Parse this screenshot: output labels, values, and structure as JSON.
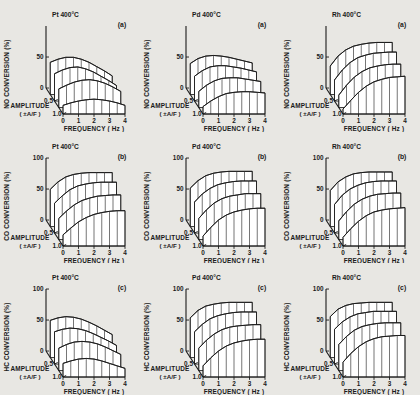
{
  "figure": {
    "background": "#e8e7e3",
    "ink": "#1a1a1a",
    "columns": [
      "Pt 400°C",
      "Pd 400°C",
      "Rh 400°C"
    ],
    "row_labels": [
      "NO CONVERSION (%)",
      "CO CONVERSION (%)",
      "HC CONVERSION (%)"
    ],
    "panel_labels": [
      "(a)",
      "(b)",
      "(c)"
    ],
    "x_axis": {
      "label": "FREQUENCY ( Hz )",
      "ticks": [
        "0",
        "1",
        "2",
        "3",
        "4"
      ],
      "range": [
        0,
        4
      ]
    },
    "y_axis": {
      "ticks_full": [
        "0",
        "50",
        "100"
      ],
      "ticks_row1": [
        "0",
        "50"
      ],
      "range": [
        0,
        100
      ]
    },
    "z_axis": {
      "label": "AMPLITUDE",
      "unit": "( ±A/F )",
      "ticks": [
        "0.5",
        "1.0"
      ],
      "range": [
        0,
        1.0
      ]
    }
  },
  "chart_data": {
    "type": "area",
    "xlabel": "FREQUENCY ( Hz )",
    "ylabel": "CONVERSION (%)",
    "zlabel": "AMPLITUDE ( ±A/F )",
    "xlim": [
      0,
      4
    ],
    "ylim": [
      0,
      100
    ],
    "zlim": [
      0,
      1.0
    ],
    "grid": false,
    "legend": "none",
    "x": [
      0,
      0.5,
      1,
      1.5,
      2,
      2.5,
      3,
      3.5,
      4
    ],
    "amplitudes": [
      0.25,
      0.5,
      0.75,
      1.0
    ],
    "panels": [
      {
        "id": "a1",
        "row": 0,
        "col": 0,
        "panel_label": "(a)",
        "catalyst": "Pt 400°C",
        "species": "NO CONVERSION (%)",
        "series": [
          {
            "name": "amplitude 0.25",
            "values": [
              52,
              57,
              60,
              60,
              57,
              52,
              45,
              38,
              30
            ]
          },
          {
            "name": "amplitude 0.50",
            "values": [
              44,
              50,
              54,
              55,
              52,
              47,
              40,
              33,
              25
            ]
          },
          {
            "name": "amplitude 0.75",
            "values": [
              30,
              36,
              41,
              44,
              45,
              43,
              39,
              33,
              26
            ]
          },
          {
            "name": "amplitude 1.00",
            "values": [
              14,
              18,
              21,
              23,
              24,
              23,
              21,
              18,
              14
            ]
          }
        ]
      },
      {
        "id": "b1",
        "row": 1,
        "col": 0,
        "panel_label": "(b)",
        "catalyst": "Pt 400°C",
        "species": "CO CONVERSION (%)",
        "series": [
          {
            "name": "amplitude 0.25",
            "values": [
              60,
              72,
              80,
              84,
              86,
              87,
              87,
              87,
              87
            ]
          },
          {
            "name": "amplitude 0.50",
            "values": [
              48,
              60,
              70,
              76,
              79,
              81,
              82,
              82,
              82
            ]
          },
          {
            "name": "amplitude 0.75",
            "values": [
              34,
              46,
              56,
              63,
              67,
              70,
              71,
              72,
              72
            ]
          },
          {
            "name": "amplitude 1.00",
            "values": [
              18,
              29,
              39,
              46,
              51,
              54,
              56,
              57,
              57
            ]
          }
        ]
      },
      {
        "id": "c1",
        "row": 2,
        "col": 0,
        "panel_label": "(c)",
        "catalyst": "Pt 400°C",
        "species": "HC CONVERSION (%)",
        "series": [
          {
            "name": "amplitude 0.25",
            "values": [
              60,
              64,
              66,
              65,
              62,
              57,
              51,
              44,
              37
            ]
          },
          {
            "name": "amplitude 0.50",
            "values": [
              52,
              56,
              58,
              57,
              54,
              49,
              43,
              37,
              30
            ]
          },
          {
            "name": "amplitude 0.75",
            "values": [
              36,
              42,
              46,
              47,
              46,
              43,
              38,
              32,
              26
            ]
          },
          {
            "name": "amplitude 1.00",
            "values": [
              22,
              26,
              29,
              30,
              29,
              26,
              22,
              18,
              14
            ]
          }
        ]
      },
      {
        "id": "a2",
        "row": 0,
        "col": 1,
        "panel_label": "(a)",
        "catalyst": "Pd 400°C",
        "species": "NO CONVERSION (%)",
        "series": [
          {
            "name": "amplitude 0.25",
            "values": [
              50,
              58,
              62,
              63,
              62,
              60,
              57,
              54,
              51
            ]
          },
          {
            "name": "amplitude 0.50",
            "values": [
              40,
              49,
              55,
              57,
              57,
              55,
              53,
              50,
              47
            ]
          },
          {
            "name": "amplitude 0.75",
            "values": [
              26,
              36,
              43,
              47,
              48,
              48,
              46,
              44,
              42
            ]
          },
          {
            "name": "amplitude 1.00",
            "values": [
              12,
              21,
              28,
              33,
              35,
              36,
              36,
              35,
              34
            ]
          }
        ]
      },
      {
        "id": "b2",
        "row": 1,
        "col": 1,
        "panel_label": "(b)",
        "catalyst": "Pd 400°C",
        "species": "CO CONVERSION (%)",
        "series": [
          {
            "name": "amplitude 0.25",
            "values": [
              62,
              74,
              82,
              86,
              88,
              89,
              89,
              89,
              89
            ]
          },
          {
            "name": "amplitude 0.50",
            "values": [
              50,
              63,
              72,
              78,
              81,
              83,
              84,
              84,
              84
            ]
          },
          {
            "name": "amplitude 0.75",
            "values": [
              34,
              48,
              59,
              66,
              70,
              72,
              74,
              74,
              74
            ]
          },
          {
            "name": "amplitude 1.00",
            "values": [
              16,
              30,
              42,
              50,
              55,
              58,
              60,
              61,
              61
            ]
          }
        ]
      },
      {
        "id": "c2",
        "row": 2,
        "col": 1,
        "panel_label": "(c)",
        "catalyst": "Pd 400°C",
        "species": "HC CONVERSION (%)",
        "series": [
          {
            "name": "amplitude 0.25",
            "values": [
              64,
              76,
              83,
              86,
              88,
              89,
              89,
              89,
              89
            ]
          },
          {
            "name": "amplitude 0.50",
            "values": [
              52,
              64,
              73,
              78,
              81,
              83,
              84,
              84,
              84
            ]
          },
          {
            "name": "amplitude 0.75",
            "values": [
              36,
              49,
              59,
              66,
              70,
              72,
              73,
              74,
              74
            ]
          },
          {
            "name": "amplitude 1.00",
            "values": [
              18,
              31,
              42,
              50,
              55,
              58,
              60,
              61,
              61
            ]
          }
        ]
      },
      {
        "id": "a3",
        "row": 0,
        "col": 2,
        "panel_label": "(a)",
        "catalyst": "Rh 400°C",
        "species": "NO CONVERSION (%)",
        "series": [
          {
            "name": "amplitude 0.25",
            "values": [
              46,
              62,
              72,
              78,
              81,
              83,
              84,
              84,
              84
            ]
          },
          {
            "name": "amplitude 0.50",
            "values": [
              34,
              50,
              62,
              70,
              74,
              77,
              78,
              79,
              79
            ]
          },
          {
            "name": "amplitude 0.75",
            "values": [
              20,
              36,
              49,
              58,
              64,
              67,
              69,
              70,
              70
            ]
          },
          {
            "name": "amplitude 1.00",
            "values": [
              8,
              22,
              35,
              45,
              52,
              56,
              59,
              60,
              61
            ]
          }
        ]
      },
      {
        "id": "b3",
        "row": 1,
        "col": 2,
        "panel_label": "(b)",
        "catalyst": "Rh 400°C",
        "species": "CO CONVERSION (%)",
        "series": [
          {
            "name": "amplitude 0.25",
            "values": [
              58,
              72,
              80,
              85,
              87,
              88,
              88,
              88,
              88
            ]
          },
          {
            "name": "amplitude 0.50",
            "values": [
              46,
              61,
              71,
              77,
              81,
              83,
              84,
              84,
              84
            ]
          },
          {
            "name": "amplitude 0.75",
            "values": [
              30,
              45,
              57,
              65,
              70,
              73,
              74,
              75,
              75
            ]
          },
          {
            "name": "amplitude 1.00",
            "values": [
              14,
              28,
              40,
              49,
              55,
              58,
              60,
              61,
              62
            ]
          }
        ]
      },
      {
        "id": "c3",
        "row": 2,
        "col": 2,
        "panel_label": "(c)",
        "catalyst": "Rh 400°C",
        "species": "HC CONVERSION (%)",
        "series": [
          {
            "name": "amplitude 0.25",
            "values": [
              66,
              78,
              84,
              87,
              88,
              89,
              89,
              89,
              89
            ]
          },
          {
            "name": "amplitude 0.50",
            "values": [
              56,
              68,
              76,
              81,
              83,
              85,
              85,
              85,
              85
            ]
          },
          {
            "name": "amplitude 0.75",
            "values": [
              42,
              55,
              65,
              71,
              74,
              76,
              77,
              77,
              77
            ]
          },
          {
            "name": "amplitude 1.00",
            "values": [
              24,
              38,
              49,
              57,
              62,
              65,
              66,
              67,
              67
            ]
          }
        ]
      }
    ]
  }
}
